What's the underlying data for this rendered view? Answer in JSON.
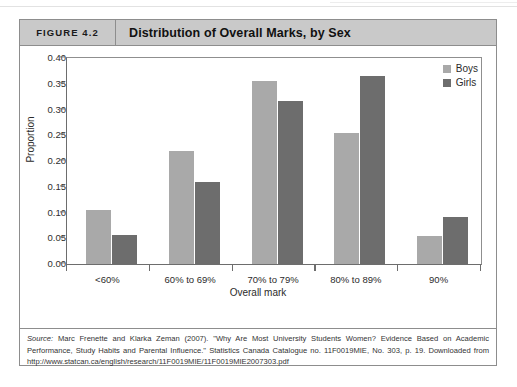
{
  "figure": {
    "number_label": "FIGURE 4.2",
    "title": "Distribution of Overall Marks, by Sex"
  },
  "source": {
    "label": "Source:",
    "text": " Marc Frenette and Klarka Zeman (2007). \"Why Are Most University Students Women? Evidence Based on Academic Performance, Study Habits and Parental Influence.\" Statistics Canada Catalogue no. 11F0019MIE, No. 303, p. 19. Downloaded from http://www.statcan.ca/english/research/11F0019MIE/11F0019MIE2007303.pdf"
  },
  "legend": {
    "boys_label": "Boys",
    "girls_label": "Girls"
  },
  "colors": {
    "boys": "#a9a9a9",
    "girls": "#6d6d6d",
    "header_band": "#c9c9c9",
    "frame": "#8d8d8d",
    "axis": "#6d6d6d"
  },
  "chart_data": {
    "type": "bar",
    "title": "Distribution of Overall Marks, by Sex",
    "xlabel": "Overall mark",
    "ylabel": "Proportion",
    "ylim": [
      0.0,
      0.4
    ],
    "ytick_labels": [
      "0.40",
      "0.35",
      "0.30",
      "0.25",
      "0.20",
      "0.15",
      "0.10",
      "0.05",
      "0.00"
    ],
    "ytick_values": [
      0.4,
      0.35,
      0.3,
      0.25,
      0.2,
      0.15,
      0.1,
      0.05,
      0.0
    ],
    "grid": false,
    "legend_position": "top-right",
    "categories": [
      "<60%",
      "60% to 69%",
      "70% to 79%",
      "80% to 89%",
      "90%"
    ],
    "series": [
      {
        "name": "Boys",
        "color": "#a9a9a9",
        "values": [
          0.105,
          0.22,
          0.355,
          0.255,
          0.054
        ]
      },
      {
        "name": "Girls",
        "color": "#6d6d6d",
        "values": [
          0.057,
          0.16,
          0.317,
          0.365,
          0.092
        ]
      }
    ]
  }
}
